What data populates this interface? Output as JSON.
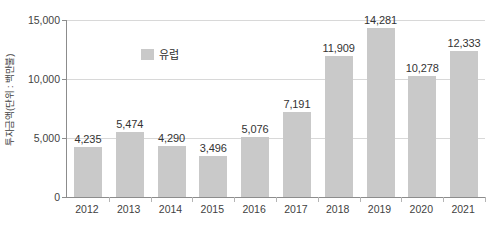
{
  "chart_data": {
    "type": "bar",
    "title": "",
    "subtitle": "",
    "xlabel": "",
    "ylabel": "투자금액(단위 : 백만불)",
    "categories": [
      "2012",
      "2013",
      "2014",
      "2015",
      "2016",
      "2017",
      "2018",
      "2019",
      "2020",
      "2021"
    ],
    "series": [
      {
        "name": "유럽",
        "values": [
          4235,
          5474,
          4290,
          3496,
          5076,
          7191,
          11909,
          14281,
          10278,
          12333
        ],
        "value_labels": [
          "4,235",
          "5,474",
          "4,290",
          "3,496",
          "5,076",
          "7,191",
          "11,909",
          "14,281",
          "10,278",
          "12,333"
        ],
        "color": "#c9c9c9"
      }
    ],
    "ylim": [
      0,
      15000
    ],
    "ytick_values": [
      0,
      5000,
      10000,
      15000
    ],
    "ytick_labels": [
      "0",
      "5,000",
      "10,000",
      "15,000"
    ],
    "grid": true,
    "grid_axis": "y",
    "legend_position": "top-left-inside",
    "legend_entries": [
      {
        "label": "유럽",
        "color": "#c9c9c9"
      }
    ]
  },
  "style": {
    "bar_color": "#c9c9c9",
    "gridline_color": "#d8d8d8",
    "axis_color": "#8c8c8c",
    "text_color": "#3f3f3f",
    "value_label_color": "#333333",
    "background": "#ffffff"
  }
}
